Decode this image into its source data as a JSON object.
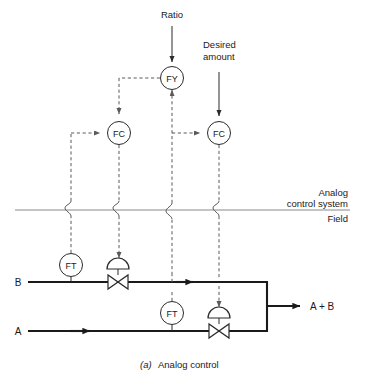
{
  "figure": {
    "caption_prefix": "(a)",
    "caption_text": "Analog control",
    "type": "process-and-instrumentation-diagram"
  },
  "labels": {
    "ratio": "Ratio",
    "desired_amount_line1": "Desired",
    "desired_amount_line2": "amount",
    "boundary_above_line1": "Analog",
    "boundary_above_line2": "control system",
    "boundary_below": "Field",
    "stream_b": "B",
    "stream_a": "A",
    "output": "A + B"
  },
  "instruments": [
    {
      "tag": "FY",
      "name": "ratio-computing-relay",
      "x": 172,
      "y": 78,
      "r": 11.5
    },
    {
      "tag": "FC",
      "name": "flow-controller-b",
      "x": 119,
      "y": 133,
      "r": 11.5
    },
    {
      "tag": "FC",
      "name": "flow-controller-a",
      "x": 219,
      "y": 133,
      "r": 11.5
    },
    {
      "tag": "FT",
      "name": "flow-transmitter-b",
      "x": 71,
      "y": 265,
      "r": 11.5
    },
    {
      "tag": "FT",
      "name": "flow-transmitter-a",
      "x": 172,
      "y": 313,
      "r": 11.5
    }
  ],
  "valves": [
    {
      "name": "control-valve-b",
      "x": 118,
      "y": 282
    },
    {
      "name": "control-valve-a",
      "x": 219,
      "y": 331
    }
  ],
  "colors": {
    "pipe": "#1a1a1a",
    "signal": "#5b5b5b",
    "instrument_outline": "#2b2b2b",
    "boundary": "#8a8a8a",
    "background": "#ffffff",
    "text": "#1a1a1a"
  },
  "geometry": {
    "stream_b_y": 282,
    "stream_a_y": 331,
    "outlet_x": 268,
    "outlet_y": 306,
    "boundary_y": 210,
    "boundary_x_start": 15,
    "boundary_x_end": 350
  }
}
